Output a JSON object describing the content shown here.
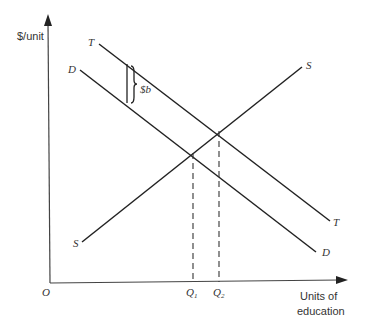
{
  "diagram": {
    "type": "supply-demand",
    "y_axis_label": "$/unit",
    "x_axis_label_line1": "Units of",
    "x_axis_label_line2": "education",
    "origin_label": "O",
    "curves": {
      "T": "T",
      "D": "D",
      "S": "S"
    },
    "brace_label": "$b",
    "q1_label": "Q",
    "q1_sub": "1",
    "q2_label": "Q",
    "q2_sub": "2"
  }
}
